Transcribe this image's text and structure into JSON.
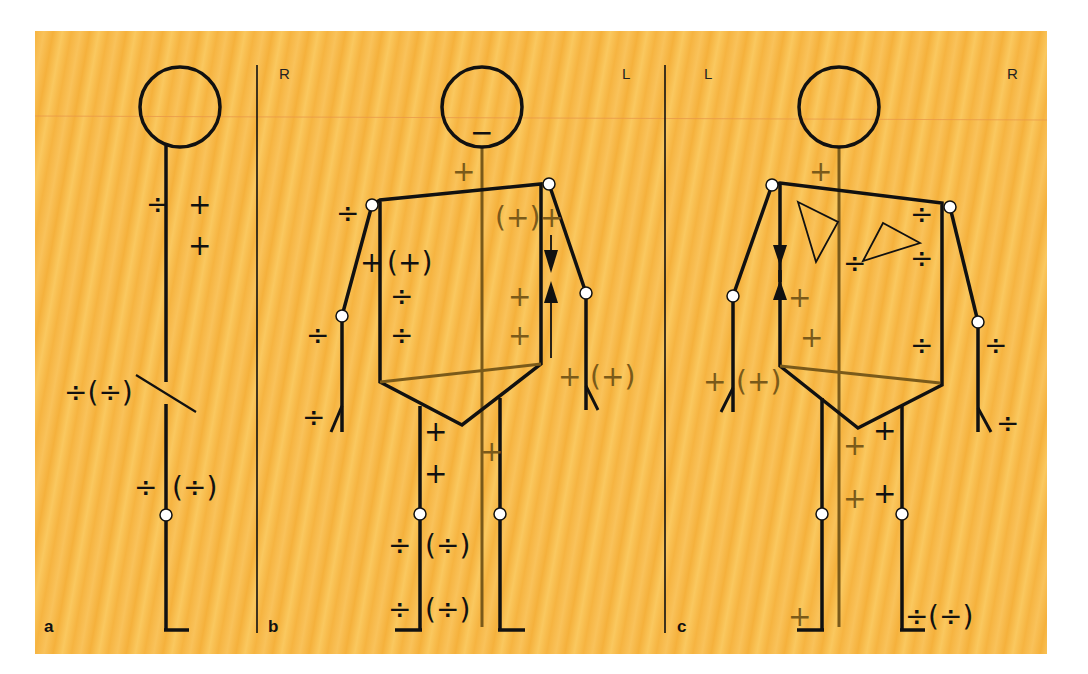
{
  "colors": {
    "background": "#f7b84a",
    "stroke_black": "#111111",
    "stroke_brown": "#7a5a1a",
    "joint_fill": "#ffffff"
  },
  "symbols": {
    "plus": "+",
    "minus": "−",
    "divide": "÷",
    "plus_paren": "(+)",
    "divide_paren": "(÷)"
  },
  "panels": [
    {
      "id": "a",
      "letter": "a",
      "view": "lateral",
      "signs": [
        {
          "text": "÷",
          "x": 146,
          "y": 214,
          "color": "black"
        },
        {
          "text": "+",
          "x": 188,
          "y": 214,
          "color": "black"
        },
        {
          "text": "+",
          "x": 188,
          "y": 255,
          "color": "black"
        },
        {
          "text": "÷(÷)",
          "x": 64,
          "y": 402,
          "color": "black"
        },
        {
          "text": "÷",
          "x": 134,
          "y": 497,
          "color": "black"
        },
        {
          "text": "(÷)",
          "x": 172,
          "y": 497,
          "color": "black"
        }
      ]
    },
    {
      "id": "b",
      "letter": "b",
      "view": "front",
      "side_labels": {
        "left": "R",
        "right": "L"
      },
      "signs": [
        {
          "text": "−",
          "x": 470,
          "y": 142,
          "color": "black"
        },
        {
          "text": "+",
          "x": 452,
          "y": 181,
          "color": "brown"
        },
        {
          "text": "÷",
          "x": 336,
          "y": 223,
          "color": "black"
        },
        {
          "text": "(+)",
          "x": 495,
          "y": 227,
          "color": "brown"
        },
        {
          "text": "+",
          "x": 540,
          "y": 227,
          "color": "brown"
        },
        {
          "text": "+",
          "x": 360,
          "y": 272,
          "color": "black"
        },
        {
          "text": "(+)",
          "x": 387,
          "y": 272,
          "color": "black"
        },
        {
          "text": "÷",
          "x": 390,
          "y": 306,
          "color": "black"
        },
        {
          "text": "+",
          "x": 508,
          "y": 306,
          "color": "brown"
        },
        {
          "text": "÷",
          "x": 306,
          "y": 345,
          "color": "black"
        },
        {
          "text": "÷",
          "x": 390,
          "y": 345,
          "color": "black"
        },
        {
          "text": "+",
          "x": 508,
          "y": 345,
          "color": "brown"
        },
        {
          "text": "+",
          "x": 558,
          "y": 386,
          "color": "brown"
        },
        {
          "text": "(+)",
          "x": 590,
          "y": 386,
          "color": "brown"
        },
        {
          "text": "÷",
          "x": 302,
          "y": 427,
          "color": "black"
        },
        {
          "text": "+",
          "x": 424,
          "y": 441,
          "color": "black"
        },
        {
          "text": "+",
          "x": 480,
          "y": 461,
          "color": "brown"
        },
        {
          "text": "+",
          "x": 424,
          "y": 483,
          "color": "black"
        },
        {
          "text": "÷",
          "x": 388,
          "y": 555,
          "color": "black"
        },
        {
          "text": "(÷)",
          "x": 425,
          "y": 555,
          "color": "black"
        },
        {
          "text": "÷",
          "x": 388,
          "y": 619,
          "color": "black"
        },
        {
          "text": "(÷)",
          "x": 425,
          "y": 619,
          "color": "black"
        }
      ]
    },
    {
      "id": "c",
      "letter": "c",
      "view": "back",
      "side_labels": {
        "left": "L",
        "right": "R"
      },
      "signs": [
        {
          "text": "+",
          "x": 809,
          "y": 181,
          "color": "brown"
        },
        {
          "text": "÷",
          "x": 910,
          "y": 224,
          "color": "black"
        },
        {
          "text": "÷",
          "x": 843,
          "y": 273,
          "color": "black"
        },
        {
          "text": "÷",
          "x": 910,
          "y": 268,
          "color": "black"
        },
        {
          "text": "+",
          "x": 788,
          "y": 307,
          "color": "brown"
        },
        {
          "text": "+",
          "x": 800,
          "y": 347,
          "color": "brown"
        },
        {
          "text": "÷",
          "x": 910,
          "y": 355,
          "color": "black"
        },
        {
          "text": "÷",
          "x": 984,
          "y": 355,
          "color": "black"
        },
        {
          "text": "+",
          "x": 703,
          "y": 391,
          "color": "brown"
        },
        {
          "text": "(+)",
          "x": 736,
          "y": 391,
          "color": "brown"
        },
        {
          "text": "÷",
          "x": 996,
          "y": 433,
          "color": "black"
        },
        {
          "text": "+",
          "x": 873,
          "y": 440,
          "color": "black"
        },
        {
          "text": "+",
          "x": 843,
          "y": 455,
          "color": "brown"
        },
        {
          "text": "+",
          "x": 873,
          "y": 503,
          "color": "black"
        },
        {
          "text": "+",
          "x": 843,
          "y": 508,
          "color": "brown"
        },
        {
          "text": "+",
          "x": 788,
          "y": 626,
          "color": "brown"
        },
        {
          "text": "÷",
          "x": 905,
          "y": 626,
          "color": "black"
        },
        {
          "text": "(÷)",
          "x": 928,
          "y": 626,
          "color": "black"
        }
      ]
    }
  ]
}
